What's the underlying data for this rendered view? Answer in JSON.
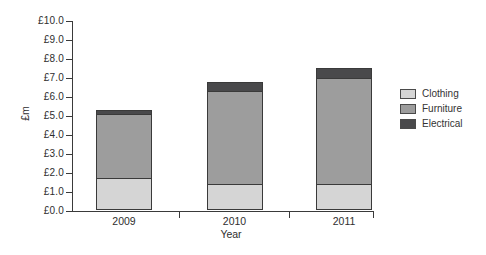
{
  "chart_data": {
    "type": "bar",
    "stacked": true,
    "title": "",
    "categories": [
      "2009",
      "2010",
      "2011"
    ],
    "series": [
      {
        "name": "Clothing",
        "color": "#d5d5d5",
        "values": [
          1.7,
          1.4,
          1.4
        ]
      },
      {
        "name": "Furniture",
        "color": "#9d9d9d",
        "values": [
          3.4,
          4.9,
          5.6
        ]
      },
      {
        "name": "Electrical",
        "color": "#49494b",
        "values": [
          0.2,
          0.45,
          0.5
        ]
      }
    ],
    "stack_totals": [
      5.3,
      6.75,
      7.5
    ],
    "xlabel": "Year",
    "ylabel": "£m",
    "ylim": [
      0,
      10
    ],
    "ytick_step": 1,
    "ytick_labels": [
      "£0.0",
      "£1.0",
      "£2.0",
      "£3.0",
      "£4.0",
      "£5.0",
      "£6.0",
      "£7.0",
      "£8.0",
      "£9.0",
      "£10.0"
    ],
    "grid": false,
    "legend_position": "right"
  },
  "colors": {
    "axis": "#3a3a3a",
    "text": "#2e2e2e",
    "background": "#ffffff",
    "segment_border": "#3a3a3a"
  }
}
